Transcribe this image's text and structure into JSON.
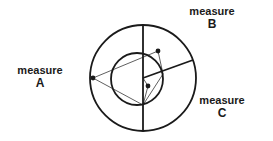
{
  "diagram": {
    "background_color": "#ffffff",
    "stroke_color": "#1a1a1a",
    "labels": {
      "a": {
        "name": "measure",
        "letter": "A"
      },
      "b": {
        "name": "measure",
        "letter": "B"
      },
      "c": {
        "name": "measure",
        "letter": "C"
      }
    },
    "geometry": {
      "outer_circle": {
        "cx": 143,
        "cy": 78,
        "r": 53,
        "stroke_width": 1.8
      },
      "inner_circle": {
        "cx": 137,
        "cy": 79,
        "r": 26,
        "stroke_width": 1.8
      },
      "vertical_diameter": {
        "x": 143,
        "y1": 25,
        "y2": 131,
        "stroke_width": 1.8
      },
      "radial_line": {
        "x1": 143,
        "y1": 78,
        "x2": 193,
        "y2": 60,
        "stroke_width": 1.8
      },
      "points": [
        {
          "id": "point-a",
          "x": 93,
          "y": 78,
          "r": 2.4
        },
        {
          "id": "point-b",
          "x": 158,
          "y": 51,
          "r": 2.4
        },
        {
          "id": "point-c",
          "x": 148,
          "y": 86,
          "r": 2.4
        }
      ],
      "thin_lines": [
        {
          "from": [
            93,
            78
          ],
          "to": [
            158,
            51
          ]
        },
        {
          "from": [
            93,
            78
          ],
          "to": [
            143,
            105
          ]
        },
        {
          "from": [
            158,
            51
          ],
          "to": [
            163,
            74
          ]
        },
        {
          "from": [
            143,
            78
          ],
          "to": [
            148,
            86
          ]
        },
        {
          "from": [
            148,
            86
          ],
          "to": [
            143,
            105
          ]
        },
        {
          "from": [
            163,
            74
          ],
          "to": [
            143,
            105
          ]
        }
      ]
    }
  }
}
